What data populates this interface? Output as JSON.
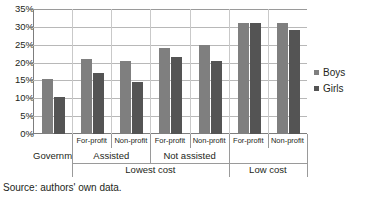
{
  "figure": {
    "source_note": "Source: authors' own data."
  },
  "legend": {
    "position": "right",
    "entries": [
      {
        "label": "Boys",
        "color": "#7f7f7f"
      },
      {
        "label": "Girls",
        "color": "#545454"
      }
    ]
  },
  "axis": {
    "y_ticks": [
      "0%",
      "5%",
      "10%",
      "15%",
      "20%",
      "25%",
      "30%",
      "35%"
    ]
  },
  "categories_row1": [
    "",
    "For-profit",
    "Non-profit",
    "For-profit",
    "Non-profit",
    "For-profit",
    "Non-profit"
  ],
  "categories_row2": [
    "Government",
    "Assisted",
    "Not assisted"
  ],
  "categories_row3": [
    "Lowest cost",
    "Low cost"
  ],
  "chart_data": {
    "type": "bar",
    "title": "",
    "subtitle": "",
    "xlabel": "",
    "ylabel": "",
    "ylim": [
      0,
      35
    ],
    "y_tick_step": 5,
    "y_unit": "%",
    "grid": true,
    "legend_position": "right",
    "categories": [
      "Government",
      "Lowest cost / Assisted / For-profit",
      "Lowest cost / Assisted / Non-profit",
      "Lowest cost / Not assisted / For-profit",
      "Lowest cost / Not assisted / Non-profit",
      "Low cost / For-profit",
      "Low cost / Non-profit"
    ],
    "series": [
      {
        "name": "Boys",
        "color": "#7f7f7f",
        "values": [
          15.5,
          21.0,
          20.5,
          24.0,
          25.0,
          31.0,
          31.0
        ]
      },
      {
        "name": "Girls",
        "color": "#545454",
        "values": [
          10.5,
          17.0,
          14.5,
          21.5,
          20.5,
          31.0,
          29.0
        ]
      }
    ],
    "annotations": [
      "Source: authors' own data."
    ]
  }
}
